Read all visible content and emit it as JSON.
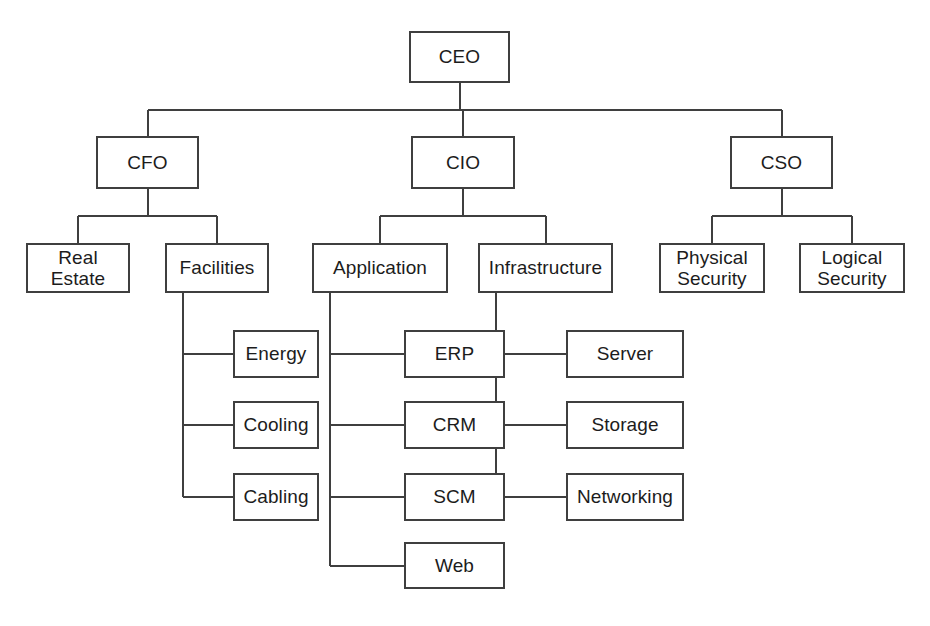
{
  "diagram": {
    "type": "org-chart",
    "orientation": "top-down",
    "canvas": {
      "width": 930,
      "height": 626
    },
    "style": {
      "background": "#ffffff",
      "box_border_color": "#3f3f3f",
      "box_fill": "#ffffff",
      "edge_color": "#3f3f3f",
      "text_color": "#1c1c1c"
    },
    "caption": {
      "text": "",
      "clipped": true
    },
    "nodes": [
      {
        "id": "ceo",
        "label": "CEO",
        "x": 409,
        "y": 31,
        "w": 101,
        "h": 52,
        "level": 0,
        "parent": null
      },
      {
        "id": "cfo",
        "label": "CFO",
        "x": 96,
        "y": 136,
        "w": 103,
        "h": 53,
        "level": 1,
        "parent": "ceo"
      },
      {
        "id": "cio",
        "label": "CIO",
        "x": 411,
        "y": 136,
        "w": 104,
        "h": 53,
        "level": 1,
        "parent": "ceo"
      },
      {
        "id": "cso",
        "label": "CSO",
        "x": 730,
        "y": 136,
        "w": 103,
        "h": 53,
        "level": 1,
        "parent": "ceo"
      },
      {
        "id": "real-estate",
        "label": "Real\nEstate",
        "x": 26,
        "y": 243,
        "w": 104,
        "h": 50,
        "level": 2,
        "parent": "cfo"
      },
      {
        "id": "facilities",
        "label": "Facilities",
        "x": 165,
        "y": 243,
        "w": 104,
        "h": 50,
        "level": 2,
        "parent": "cfo"
      },
      {
        "id": "application",
        "label": "Application",
        "x": 312,
        "y": 243,
        "w": 136,
        "h": 50,
        "level": 2,
        "parent": "cio"
      },
      {
        "id": "infrastructure",
        "label": "Infrastructure",
        "x": 478,
        "y": 243,
        "w": 135,
        "h": 50,
        "level": 2,
        "parent": "cio"
      },
      {
        "id": "physical-security",
        "label": "Physical\nSecurity",
        "x": 659,
        "y": 243,
        "w": 106,
        "h": 50,
        "level": 2,
        "parent": "cso"
      },
      {
        "id": "logical-security",
        "label": "Logical\nSecurity",
        "x": 799,
        "y": 243,
        "w": 106,
        "h": 50,
        "level": 2,
        "parent": "cso"
      },
      {
        "id": "energy",
        "label": "Energy",
        "x": 233,
        "y": 330,
        "w": 86,
        "h": 48,
        "level": 3,
        "parent": "facilities"
      },
      {
        "id": "cooling",
        "label": "Cooling",
        "x": 233,
        "y": 401,
        "w": 86,
        "h": 48,
        "level": 3,
        "parent": "facilities"
      },
      {
        "id": "cabling",
        "label": "Cabling",
        "x": 233,
        "y": 473,
        "w": 86,
        "h": 48,
        "level": 3,
        "parent": "facilities"
      },
      {
        "id": "erp",
        "label": "ERP",
        "x": 404,
        "y": 330,
        "w": 101,
        "h": 48,
        "level": 3,
        "parent": "application"
      },
      {
        "id": "crm",
        "label": "CRM",
        "x": 404,
        "y": 401,
        "w": 101,
        "h": 48,
        "level": 3,
        "parent": "application"
      },
      {
        "id": "scm",
        "label": "SCM",
        "x": 404,
        "y": 473,
        "w": 101,
        "h": 48,
        "level": 3,
        "parent": "application"
      },
      {
        "id": "web",
        "label": "Web",
        "x": 404,
        "y": 542,
        "w": 101,
        "h": 47,
        "level": 3,
        "parent": "application"
      },
      {
        "id": "server",
        "label": "Server",
        "x": 566,
        "y": 330,
        "w": 118,
        "h": 48,
        "level": 3,
        "parent": "infrastructure"
      },
      {
        "id": "storage",
        "label": "Storage",
        "x": 566,
        "y": 401,
        "w": 118,
        "h": 48,
        "level": 3,
        "parent": "infrastructure"
      },
      {
        "id": "networking",
        "label": "Networking",
        "x": 566,
        "y": 473,
        "w": 118,
        "h": 48,
        "level": 3,
        "parent": "infrastructure"
      }
    ],
    "edges": [
      {
        "from": "ceo",
        "to": "cfo",
        "style": "orthogonal-bus"
      },
      {
        "from": "ceo",
        "to": "cio",
        "style": "orthogonal-bus"
      },
      {
        "from": "ceo",
        "to": "cso",
        "style": "orthogonal-bus"
      },
      {
        "from": "cfo",
        "to": "real-estate",
        "style": "orthogonal-bus"
      },
      {
        "from": "cfo",
        "to": "facilities",
        "style": "orthogonal-bus"
      },
      {
        "from": "cio",
        "to": "application",
        "style": "orthogonal-bus"
      },
      {
        "from": "cio",
        "to": "infrastructure",
        "style": "orthogonal-bus"
      },
      {
        "from": "cso",
        "to": "physical-security",
        "style": "orthogonal-bus"
      },
      {
        "from": "cso",
        "to": "logical-security",
        "style": "orthogonal-bus"
      },
      {
        "from": "facilities",
        "to": "energy",
        "style": "elbow-left"
      },
      {
        "from": "facilities",
        "to": "cooling",
        "style": "elbow-left"
      },
      {
        "from": "facilities",
        "to": "cabling",
        "style": "elbow-left"
      },
      {
        "from": "application",
        "to": "erp",
        "style": "elbow-left"
      },
      {
        "from": "application",
        "to": "crm",
        "style": "elbow-left"
      },
      {
        "from": "application",
        "to": "scm",
        "style": "elbow-left"
      },
      {
        "from": "application",
        "to": "web",
        "style": "elbow-left"
      },
      {
        "from": "infrastructure",
        "to": "server",
        "style": "elbow-left"
      },
      {
        "from": "infrastructure",
        "to": "storage",
        "style": "elbow-left"
      },
      {
        "from": "infrastructure",
        "to": "networking",
        "style": "elbow-left"
      }
    ]
  }
}
